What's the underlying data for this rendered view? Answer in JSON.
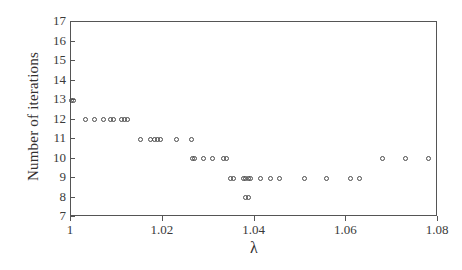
{
  "chart_data": {
    "type": "scatter",
    "title": "",
    "xlabel": "λ",
    "ylabel": "Number of iterations",
    "xlim": [
      1.0,
      1.08
    ],
    "ylim": [
      7,
      17
    ],
    "grid": false,
    "legend": null,
    "marker": "open-circle",
    "xticks": [
      "1",
      "1.02",
      "1.04",
      "1.06",
      "1.08"
    ],
    "xtick_values": [
      1.0,
      1.02,
      1.04,
      1.06,
      1.08
    ],
    "yticks": [
      "7",
      "8",
      "9",
      "10",
      "11",
      "12",
      "13",
      "14",
      "15",
      "16",
      "17"
    ],
    "ytick_values": [
      7,
      8,
      9,
      10,
      11,
      12,
      13,
      14,
      15,
      16,
      17
    ],
    "points": [
      {
        "x": 1.0,
        "y": 13
      },
      {
        "x": 1.0006,
        "y": 13
      },
      {
        "x": 1.0032,
        "y": 12
      },
      {
        "x": 1.0051,
        "y": 12
      },
      {
        "x": 1.0071,
        "y": 12
      },
      {
        "x": 1.0086,
        "y": 12
      },
      {
        "x": 1.0093,
        "y": 12
      },
      {
        "x": 1.011,
        "y": 12
      },
      {
        "x": 1.0117,
        "y": 12
      },
      {
        "x": 1.0124,
        "y": 12
      },
      {
        "x": 1.0152,
        "y": 11
      },
      {
        "x": 1.0174,
        "y": 11
      },
      {
        "x": 1.0181,
        "y": 11
      },
      {
        "x": 1.0188,
        "y": 11
      },
      {
        "x": 1.0195,
        "y": 11
      },
      {
        "x": 1.0231,
        "y": 11
      },
      {
        "x": 1.0262,
        "y": 11
      },
      {
        "x": 1.0264,
        "y": 10
      },
      {
        "x": 1.027,
        "y": 10
      },
      {
        "x": 1.0289,
        "y": 10
      },
      {
        "x": 1.0309,
        "y": 10
      },
      {
        "x": 1.0333,
        "y": 10
      },
      {
        "x": 1.034,
        "y": 10
      },
      {
        "x": 1.0348,
        "y": 9
      },
      {
        "x": 1.0355,
        "y": 9
      },
      {
        "x": 1.0375,
        "y": 9
      },
      {
        "x": 1.0381,
        "y": 9
      },
      {
        "x": 1.0386,
        "y": 9
      },
      {
        "x": 1.0392,
        "y": 9
      },
      {
        "x": 1.0413,
        "y": 9
      },
      {
        "x": 1.0434,
        "y": 9
      },
      {
        "x": 1.0455,
        "y": 9
      },
      {
        "x": 1.0508,
        "y": 9
      },
      {
        "x": 1.0558,
        "y": 9
      },
      {
        "x": 1.0609,
        "y": 9
      },
      {
        "x": 1.0629,
        "y": 9
      },
      {
        "x": 1.0381,
        "y": 8
      },
      {
        "x": 1.0386,
        "y": 8
      },
      {
        "x": 1.068,
        "y": 10
      },
      {
        "x": 1.073,
        "y": 10
      },
      {
        "x": 1.0779,
        "y": 10
      }
    ]
  },
  "axis": {
    "x_label_text": "λ",
    "y_label_text": "Number of iterations"
  },
  "colors": {
    "frame": "#555555",
    "marker_stroke": "#4a4a4a",
    "text": "#33302f",
    "background": "#ffffff"
  }
}
